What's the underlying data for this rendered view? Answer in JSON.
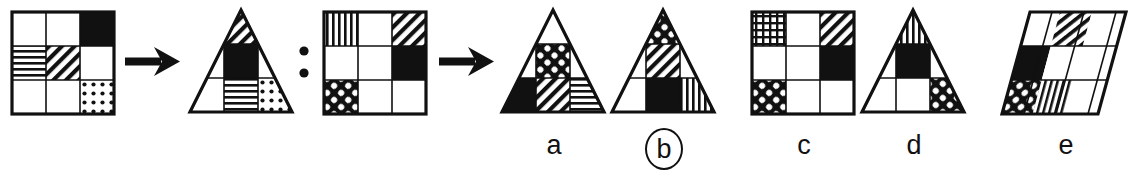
{
  "item": {
    "type": "visual-analogy-matrix-reasoning",
    "relation_symbol": ":",
    "arrow_symbol": "→",
    "prompt_structure": "A → B : C → ?",
    "selected_option": "b"
  },
  "patterns": {
    "white": "white-fill",
    "black": "black-fill",
    "hlines": "horizontal-lines-hatch",
    "vlines": "vertical-lines-hatch",
    "diag": "diagonal-stripes-hatch",
    "dots": "polka-dots-hatch",
    "cross": "crosshatch-diamond-hatch",
    "grid": "fine-grid-hatch"
  },
  "colors": {
    "ink": "#111111",
    "paper": "#ffffff"
  },
  "stimuli": [
    {
      "id": "term-a",
      "name": "source-square",
      "shape": "square",
      "cells": [
        [
          "white",
          "white",
          "black"
        ],
        [
          "hlines",
          "diag",
          "white"
        ],
        [
          "white",
          "white",
          "dots"
        ]
      ]
    },
    {
      "id": "term-b",
      "name": "source-triangle",
      "shape": "triangle",
      "cells": [
        [
          "white",
          "diag",
          "white"
        ],
        [
          "white",
          "black",
          "white"
        ],
        [
          "white",
          "hlines",
          "dots"
        ]
      ]
    },
    {
      "id": "term-c",
      "name": "target-square",
      "shape": "square",
      "cells": [
        [
          "vlines",
          "white",
          "diag"
        ],
        [
          "white",
          "white",
          "black"
        ],
        [
          "cross",
          "white",
          "white"
        ]
      ]
    }
  ],
  "options": [
    {
      "id": "a",
      "label": "a",
      "shape": "triangle",
      "circled": false,
      "cells": [
        [
          "white",
          "white",
          "white"
        ],
        [
          "white",
          "cross",
          "white"
        ],
        [
          "black",
          "diag",
          "hlines"
        ]
      ]
    },
    {
      "id": "b",
      "label": "b",
      "shape": "triangle",
      "circled": true,
      "cells": [
        [
          "white",
          "cross",
          "white"
        ],
        [
          "white",
          "diag",
          "white"
        ],
        [
          "white",
          "black",
          "vlines"
        ]
      ]
    },
    {
      "id": "c",
      "label": "c",
      "shape": "square",
      "circled": false,
      "cells": [
        [
          "grid",
          "white",
          "diag"
        ],
        [
          "white",
          "white",
          "black"
        ],
        [
          "cross",
          "white",
          "white"
        ]
      ]
    },
    {
      "id": "d",
      "label": "d",
      "shape": "triangle",
      "circled": false,
      "cells": [
        [
          "white",
          "vlines",
          "white"
        ],
        [
          "white",
          "black",
          "white"
        ],
        [
          "white",
          "white",
          "cross"
        ]
      ]
    },
    {
      "id": "e",
      "label": "e",
      "shape": "parallelogram",
      "circled": false,
      "cells": [
        [
          "white",
          "diag",
          "white"
        ],
        [
          "black",
          "white",
          "white"
        ],
        [
          "cross",
          "vlines",
          "white"
        ]
      ]
    }
  ],
  "connectors": [
    {
      "id": "arrow-1",
      "name": "arrow-a-to-b",
      "symbol": "→"
    },
    {
      "id": "colon",
      "name": "analogy-colon",
      "symbol": ":"
    },
    {
      "id": "arrow-2",
      "name": "arrow-c-to-answer",
      "symbol": "→"
    }
  ]
}
